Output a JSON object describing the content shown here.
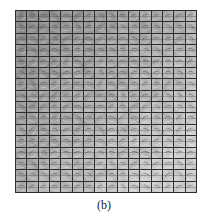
{
  "figure": {
    "caption": "(b)",
    "grid": {
      "rows": 16,
      "columns": 16,
      "line_color": "#2e2e2e",
      "dark_cell_color": "#9a9a9a",
      "light_cell_color": "#dcdcdc",
      "description": "Grid of grayscale patch visualizations; darker toward upper-left, lighter toward lower-right"
    }
  }
}
